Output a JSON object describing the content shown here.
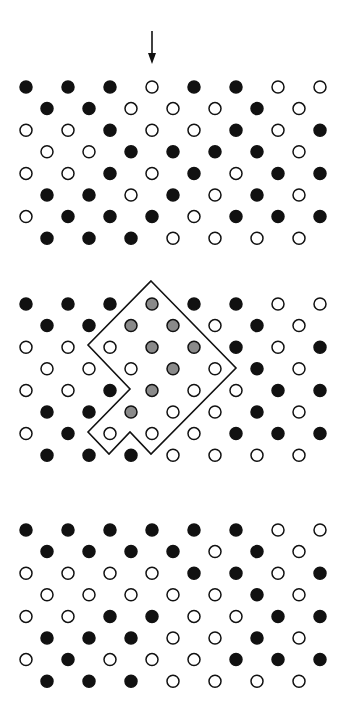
{
  "colors": {
    "filled": "#111111",
    "empty_fill": "#ffffff",
    "empty_stroke": "#111111",
    "highlight": "#8a8a8a",
    "outline": "#111111",
    "background": "#ffffff"
  },
  "grid": {
    "even_x": [
      26,
      68,
      110,
      152,
      194,
      236,
      278,
      320
    ],
    "odd_x": [
      47,
      89,
      131,
      173,
      215,
      257,
      299
    ],
    "row_step": 21.6,
    "radius": 6
  },
  "arrow": {
    "x": 152,
    "y1": 31,
    "y2": 64
  },
  "panels": [
    {
      "name": "top",
      "y0": 87,
      "rows": [
        "FFFOFFOO",
        "FFOOOFO",
        "OOFOOFOF",
        "OOFFFFO",
        "OOFOFOFF",
        "FFOFOFO",
        "OFFFOFFF",
        "FFFOOOO"
      ]
    },
    {
      "name": "middle",
      "y0": 304,
      "rows": [
        "FFFGFFOO",
        "FFGGOFO",
        "OOOGGFOF",
        "OOOGOFO",
        "OOFGOOFF",
        "FFGOOFO",
        "OFOOOFFF",
        "FFFOOOO"
      ],
      "outline": [
        [
          151,
          281
        ],
        [
          236,
          368
        ],
        [
          151,
          454
        ],
        [
          130,
          432
        ],
        [
          109,
          454
        ],
        [
          88,
          432
        ],
        [
          130,
          389
        ],
        [
          88,
          345
        ]
      ]
    },
    {
      "name": "bottom",
      "y0": 530,
      "rows": [
        "FFFFFFOO",
        "FFFFOFO",
        "OOOOFFOF",
        "OOOOOFO",
        "OOFFOOFF",
        "FFFOOFO",
        "OFOOOFFF",
        "FFFOOOO"
      ]
    }
  ]
}
